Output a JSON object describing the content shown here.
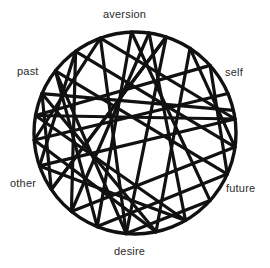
{
  "diagram": {
    "type": "chord-circle",
    "title": "",
    "stroke_color": "#111111",
    "background_color": "#ffffff",
    "label_color": "#2b2b2b",
    "circle": {
      "cx": 135,
      "cy": 133,
      "r": 101,
      "stroke_width": 3.4
    },
    "chord_stroke_width": 3.2,
    "labels": [
      {
        "id": "aversion",
        "text": "aversion",
        "position": "top",
        "angle_deg": 270
      },
      {
        "id": "past",
        "text": "past",
        "position": "upper-left",
        "angle_deg": 200
      },
      {
        "id": "self",
        "text": "self",
        "position": "upper-right",
        "angle_deg": 340
      },
      {
        "id": "other",
        "text": "other",
        "position": "lower-left",
        "angle_deg": 160
      },
      {
        "id": "future",
        "text": "future",
        "position": "lower-right",
        "angle_deg": 20
      },
      {
        "id": "desire",
        "text": "desire",
        "position": "bottom",
        "angle_deg": 90
      }
    ],
    "nodes": [
      {
        "id": "n0",
        "angle_deg": 268,
        "x": 131.5,
        "y": 32.0
      },
      {
        "id": "n1",
        "angle_deg": 288,
        "x": 166.2,
        "y": 37.0
      },
      {
        "id": "n2",
        "angle_deg": 303,
        "x": 190.0,
        "y": 48.3
      },
      {
        "id": "n3",
        "angle_deg": 318,
        "x": 210.1,
        "y": 65.4
      },
      {
        "id": "n4",
        "angle_deg": 337,
        "x": 228.0,
        "y": 93.5
      },
      {
        "id": "n5",
        "angle_deg": 352,
        "x": 235.0,
        "y": 119.0
      },
      {
        "id": "n6",
        "angle_deg": 8,
        "x": 235.0,
        "y": 147.1
      },
      {
        "id": "n7",
        "angle_deg": 24,
        "x": 227.3,
        "y": 174.1
      },
      {
        "id": "n8",
        "angle_deg": 42,
        "x": 210.1,
        "y": 200.6
      },
      {
        "id": "n9",
        "angle_deg": 60,
        "x": 185.5,
        "y": 220.5
      },
      {
        "id": "n10",
        "angle_deg": 78,
        "x": 156.0,
        "y": 231.8
      },
      {
        "id": "n11",
        "angle_deg": 95,
        "x": 126.2,
        "y": 233.6
      },
      {
        "id": "n12",
        "angle_deg": 112,
        "x": 97.2,
        "y": 226.6
      },
      {
        "id": "n13",
        "angle_deg": 129,
        "x": 71.4,
        "y": 211.5
      },
      {
        "id": "n14",
        "angle_deg": 146,
        "x": 51.3,
        "y": 189.5
      },
      {
        "id": "n15",
        "angle_deg": 161,
        "x": 39.5,
        "y": 165.9
      },
      {
        "id": "n16",
        "angle_deg": 176,
        "x": 34.2,
        "y": 140.0
      },
      {
        "id": "n17",
        "angle_deg": 190,
        "x": 35.5,
        "y": 115.5
      },
      {
        "id": "n18",
        "angle_deg": 203,
        "x": 42.0,
        "y": 93.6
      },
      {
        "id": "n19",
        "angle_deg": 218,
        "x": 55.4,
        "y": 70.8
      },
      {
        "id": "n20",
        "angle_deg": 234,
        "x": 75.6,
        "y": 51.3
      },
      {
        "id": "n21",
        "angle_deg": 250,
        "x": 100.4,
        "y": 38.1
      },
      {
        "id": "n22",
        "angle_deg": 278,
        "x": 149.1,
        "y": 33.0
      },
      {
        "id": "n23",
        "angle_deg": 347,
        "x": 233.4,
        "y": 110.3
      }
    ],
    "chords": [
      [
        "n21",
        "n11"
      ],
      [
        "n21",
        "n5"
      ],
      [
        "n0",
        "n12"
      ],
      [
        "n0",
        "n8"
      ],
      [
        "n22",
        "n9"
      ],
      [
        "n22",
        "n13"
      ],
      [
        "n1",
        "n11"
      ],
      [
        "n1",
        "n14"
      ],
      [
        "n2",
        "n6"
      ],
      [
        "n2",
        "n10"
      ],
      [
        "n3",
        "n7"
      ],
      [
        "n3",
        "n17"
      ],
      [
        "n4",
        "n16"
      ],
      [
        "n23",
        "n18"
      ],
      [
        "n5",
        "n15"
      ],
      [
        "n6",
        "n13"
      ],
      [
        "n7",
        "n12"
      ],
      [
        "n8",
        "n11"
      ],
      [
        "n9",
        "n15"
      ],
      [
        "n10",
        "n16"
      ],
      [
        "n12",
        "n19"
      ],
      [
        "n13",
        "n20"
      ],
      [
        "n14",
        "n18"
      ],
      [
        "n15",
        "n20"
      ],
      [
        "n16",
        "n21"
      ],
      [
        "n17",
        "n9"
      ],
      [
        "n18",
        "n10"
      ],
      [
        "n19",
        "n7"
      ],
      [
        "n20",
        "n6"
      ],
      [
        "n11",
        "n19"
      ],
      [
        "n14",
        "n1"
      ],
      [
        "n5",
        "n17"
      ]
    ]
  }
}
